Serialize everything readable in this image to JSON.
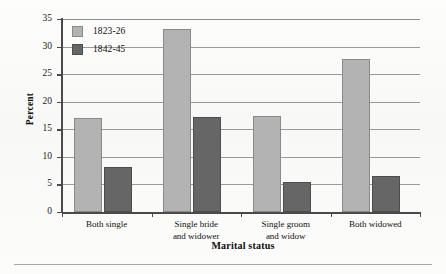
{
  "chart_data": {
    "type": "bar",
    "title": "",
    "subtitle": "",
    "xlabel": "Marital status",
    "ylabel": "Percent",
    "categories": [
      "Both single",
      "Single bride\nand widower",
      "Single groom\nand widow",
      "Both widowed"
    ],
    "category_lines": [
      [
        "Both single"
      ],
      [
        "Single bride",
        "and widower"
      ],
      [
        "Single groom",
        "and widow"
      ],
      [
        "Both widowed"
      ]
    ],
    "series": [
      {
        "name": "1823-26",
        "color": "#b3b3b3",
        "values": [
          17.1,
          33.2,
          17.4,
          27.7
        ]
      },
      {
        "name": "1842-45",
        "color": "#666666",
        "values": [
          8.2,
          17.3,
          5.4,
          6.6
        ]
      }
    ],
    "ylim": [
      0,
      35
    ],
    "ytick_step": 5,
    "yticks": [
      0,
      5,
      10,
      15,
      20,
      25,
      30,
      35
    ],
    "ytick_labels": [
      "0",
      "5",
      "10",
      "15",
      "20",
      "25",
      "30",
      "35"
    ],
    "grid": true,
    "grid_axis": "y",
    "legend_position": "top-left"
  },
  "legend": {
    "entries": [
      {
        "label": "1823-26"
      },
      {
        "label": "1842-45"
      }
    ]
  },
  "axes": {
    "y_title": "Percent",
    "x_title": "Marital status"
  }
}
